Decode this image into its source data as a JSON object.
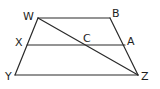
{
  "figure": {
    "stroke_color": "#2a2a2a",
    "label_color": "#1e1e1e",
    "points": {
      "W": {
        "x": 38,
        "y": 18
      },
      "B": {
        "x": 110,
        "y": 18
      },
      "X": {
        "x": 27,
        "y": 45
      },
      "A": {
        "x": 125,
        "y": 45
      },
      "C": {
        "x": 84,
        "y": 45
      },
      "Y": {
        "x": 15,
        "y": 75
      },
      "Z": {
        "x": 138,
        "y": 75
      }
    },
    "segments": [
      {
        "from": "W",
        "to": "B"
      },
      {
        "from": "W",
        "to": "Y"
      },
      {
        "from": "B",
        "to": "Z"
      },
      {
        "from": "Y",
        "to": "Z"
      },
      {
        "from": "X",
        "to": "A"
      },
      {
        "from": "W",
        "to": "Z"
      }
    ],
    "labels": {
      "W": {
        "text": "W",
        "x": 23,
        "y": 20
      },
      "B": {
        "text": "B",
        "x": 112,
        "y": 17
      },
      "X": {
        "text": "X",
        "x": 15,
        "y": 46
      },
      "C": {
        "text": "C",
        "x": 83,
        "y": 42
      },
      "A": {
        "text": "A",
        "x": 127,
        "y": 45
      },
      "Y": {
        "text": "Y",
        "x": 5,
        "y": 80
      },
      "Z": {
        "text": "Z",
        "x": 141,
        "y": 80
      }
    }
  }
}
